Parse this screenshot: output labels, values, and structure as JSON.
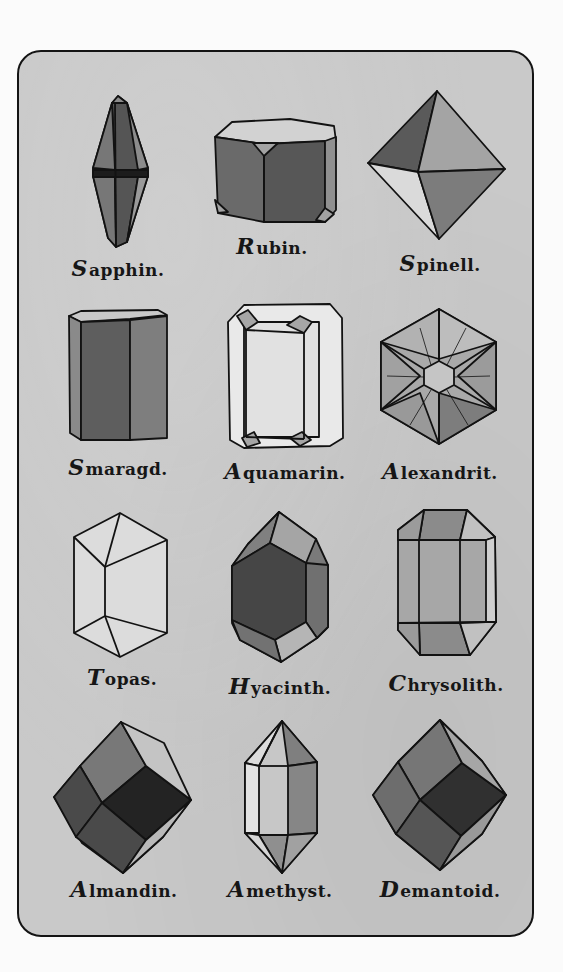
{
  "plate": {
    "background": "#c9c9c9",
    "border_color": "#141414",
    "page_background": "#fbfbfb"
  },
  "gems": [
    {
      "name": "Sapphin.",
      "initial": "S",
      "rest": "apphin.",
      "row": 1,
      "col": 1,
      "shape": "hexagonal-bipyramid"
    },
    {
      "name": "Rubin.",
      "initial": "R",
      "rest": "ubin.",
      "row": 1,
      "col": 2,
      "shape": "hexagonal-prism-tabular"
    },
    {
      "name": "Spinell.",
      "initial": "S",
      "rest": "pinell.",
      "row": 1,
      "col": 3,
      "shape": "octahedron"
    },
    {
      "name": "Smaragd.",
      "initial": "S",
      "rest": "maragd.",
      "row": 2,
      "col": 1,
      "shape": "hexagonal-prism"
    },
    {
      "name": "Aquamarin.",
      "initial": "A",
      "rest": "quamarin.",
      "row": 2,
      "col": 2,
      "shape": "prism-top-view"
    },
    {
      "name": "Alexandrit.",
      "initial": "A",
      "rest": "lexandrit.",
      "row": 2,
      "col": 3,
      "shape": "hexagonal-twin"
    },
    {
      "name": "Topas.",
      "initial": "T",
      "rest": "opas.",
      "row": 3,
      "col": 1,
      "shape": "rhombic-prism"
    },
    {
      "name": "Hyacinth.",
      "initial": "H",
      "rest": "yacinth.",
      "row": 3,
      "col": 2,
      "shape": "zircon"
    },
    {
      "name": "Chrysolith.",
      "initial": "C",
      "rest": "hrysolith.",
      "row": 3,
      "col": 3,
      "shape": "orthorhombic-prism"
    },
    {
      "name": "Almandin.",
      "initial": "A",
      "rest": "lmandin.",
      "row": 4,
      "col": 1,
      "shape": "rhombic-dodecahedron"
    },
    {
      "name": "Amethyst.",
      "initial": "A",
      "rest": "methyst.",
      "row": 4,
      "col": 2,
      "shape": "hexagonal-prism-bipyramid"
    },
    {
      "name": "Demantoid.",
      "initial": "D",
      "rest": "emantoid.",
      "row": 4,
      "col": 3,
      "shape": "rhombic-dodecahedron"
    }
  ]
}
